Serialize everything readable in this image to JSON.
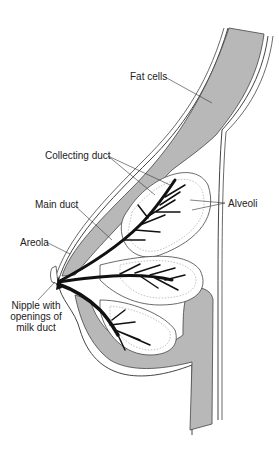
{
  "diagram": {
    "type": "anatomical cross-section",
    "colors": {
      "fat_tissue": "#b8b8b8",
      "outline": "#444444",
      "ducts": "#111111",
      "alveoli_stipple": "#999999",
      "background": "#ffffff"
    },
    "labels": {
      "fat_cells": "Fat cells",
      "collecting_duct": "Collecting duct",
      "alveoli": "Alveoli",
      "main_duct": "Main duct",
      "areola": "Areola",
      "nipple_line1": "Nipple with",
      "nipple_line2": "openings of",
      "nipple_line3": "milk duct"
    }
  }
}
